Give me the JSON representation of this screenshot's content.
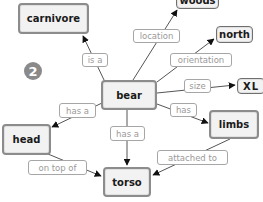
{
  "diagram": {
    "type": "concept-map",
    "badge": "2",
    "nodes": {
      "bear": "bear",
      "carnivore": "carnivore",
      "woods": "woods",
      "north": "north",
      "xl": "XL",
      "limbs": "limbs",
      "head": "head",
      "torso": "torso"
    },
    "links": {
      "is_a": "is a",
      "location": "location",
      "orientation": "orientation",
      "size": "size",
      "has": "has",
      "has_a_head": "has a",
      "has_a_torso": "has a",
      "on_top_of": "on top of",
      "attached_to": "attached to"
    },
    "edges": [
      {
        "from": "bear",
        "label": "is a",
        "to": "carnivore"
      },
      {
        "from": "bear",
        "label": "location",
        "to": "woods"
      },
      {
        "from": "bear",
        "label": "orientation",
        "to": "north"
      },
      {
        "from": "bear",
        "label": "size",
        "to": "XL"
      },
      {
        "from": "bear",
        "label": "has",
        "to": "limbs"
      },
      {
        "from": "bear",
        "label": "has a",
        "to": "head"
      },
      {
        "from": "bear",
        "label": "has a",
        "to": "torso"
      },
      {
        "from": "head",
        "label": "on top of",
        "to": "torso"
      },
      {
        "from": "limbs",
        "label": "attached to",
        "to": "torso"
      }
    ],
    "colors": {
      "node_fill": "#f2f2f2",
      "node_border": "#8c8c8c",
      "link_text": "#9a9a9a",
      "edge": "#555555",
      "badge": "#8a8a8a"
    }
  }
}
